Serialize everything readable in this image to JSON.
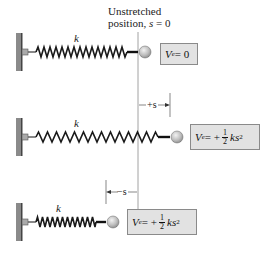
{
  "header": {
    "line1": "Unstretched",
    "line2_prefix": "position, ",
    "line2_var": "s",
    "line2_suffix": " = 0"
  },
  "colors": {
    "spring": "#1a1a1a",
    "wall": "#777777",
    "box_fill": "#e2e2e2",
    "box_border": "#8a8a8a",
    "ball": "#bdbdbd",
    "reference_line": "#8c8c8c"
  },
  "rows": [
    {
      "state": "unstretched",
      "spring_label": "k",
      "energy": {
        "symbol": "V",
        "subscript": "e",
        "equals": " = 0"
      }
    },
    {
      "state": "stretched",
      "spring_label": "k",
      "displacement_label": "+s",
      "energy": {
        "symbol": "V",
        "subscript": "e",
        "equals": " = +",
        "frac_num": "1",
        "frac_den": "2",
        "tail": "ks",
        "exponent": "2"
      }
    },
    {
      "state": "compressed",
      "spring_label": "k",
      "displacement_label": "−s",
      "energy": {
        "symbol": "V",
        "subscript": "e",
        "equals": " = +",
        "frac_num": "1",
        "frac_den": "2",
        "tail": "ks",
        "exponent": "2"
      }
    }
  ]
}
